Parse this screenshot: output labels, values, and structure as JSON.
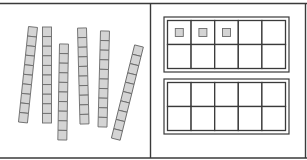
{
  "diagram": {
    "colors": {
      "line": "#3a3a3a",
      "unit_fill": "#d4d4d4",
      "unit_stroke": "#6b6b6b",
      "background": "#ffffff"
    },
    "left_panel": {
      "label": "Tens",
      "rods": [
        {
          "x": 33,
          "y": 27,
          "angle": 6,
          "units": 10
        },
        {
          "x": 47,
          "y": 27,
          "angle": 0,
          "units": 10
        },
        {
          "x": 64,
          "y": 44,
          "angle": 1,
          "units": 10
        },
        {
          "x": 82,
          "y": 28,
          "angle": -1.5,
          "units": 10
        },
        {
          "x": 105,
          "y": 31,
          "angle": 1.5,
          "units": 10
        },
        {
          "x": 139,
          "y": 46,
          "angle": 14,
          "units": 10
        }
      ],
      "total_tens": 6
    },
    "right_panel": {
      "label": "Ones",
      "ten_frames": [
        {
          "rows": 2,
          "cols": 5,
          "filled_cells": [
            0,
            1,
            2
          ]
        },
        {
          "rows": 2,
          "cols": 5,
          "filled_cells": []
        }
      ],
      "total_ones": 3
    },
    "represented_number": 63
  }
}
